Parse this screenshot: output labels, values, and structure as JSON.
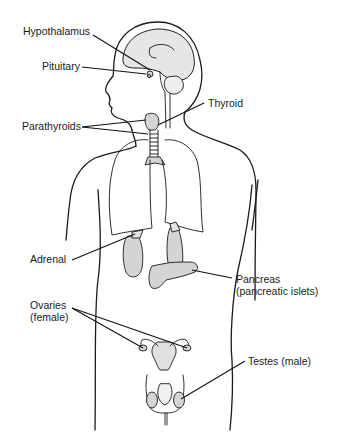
{
  "diagram": {
    "labels": {
      "hypothalamus": "Hypothalamus",
      "pituitary": "Pituitary",
      "thyroid": "Thyroid",
      "parathyroids": "Parathyroids",
      "adrenal": "Adrenal",
      "pancreas_line1": "Pancreas",
      "pancreas_line2": "(pancreatic islets)",
      "ovaries_line1": "Ovaries",
      "ovaries_line2": "(female)",
      "testes": "Testes (male)"
    },
    "colors": {
      "background": "#ffffff",
      "outline": "#1a1a1a",
      "organ_fill": "#d4d4d4",
      "brain_fill": "#e6e6e6"
    }
  }
}
